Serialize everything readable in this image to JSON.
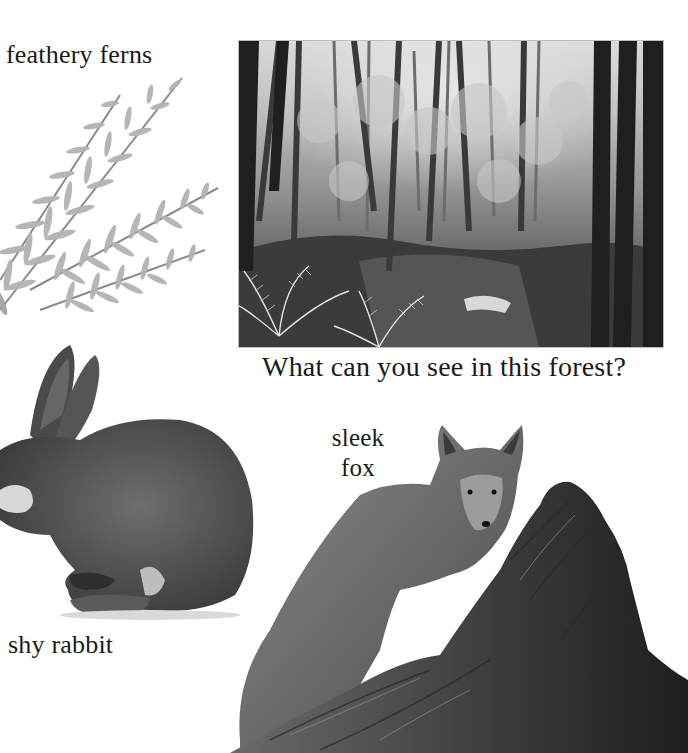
{
  "page": {
    "captions": {
      "ferns": "feathery ferns",
      "question": "What can you see in this forest?",
      "fox_line1": "sleek",
      "fox_line2": "fox",
      "rabbit": "shy rabbit"
    },
    "images": {
      "forest_photo": "black-and-white forest scene with trees, ferns and a stream",
      "fern": "feathery fern fronds",
      "rabbit": "rabbit grooming its face",
      "fox": "fox standing behind a fallen log"
    },
    "colors": {
      "background": "#ffffff",
      "text": "#1a1a1a",
      "photo_border": "#bdbdbd"
    }
  }
}
